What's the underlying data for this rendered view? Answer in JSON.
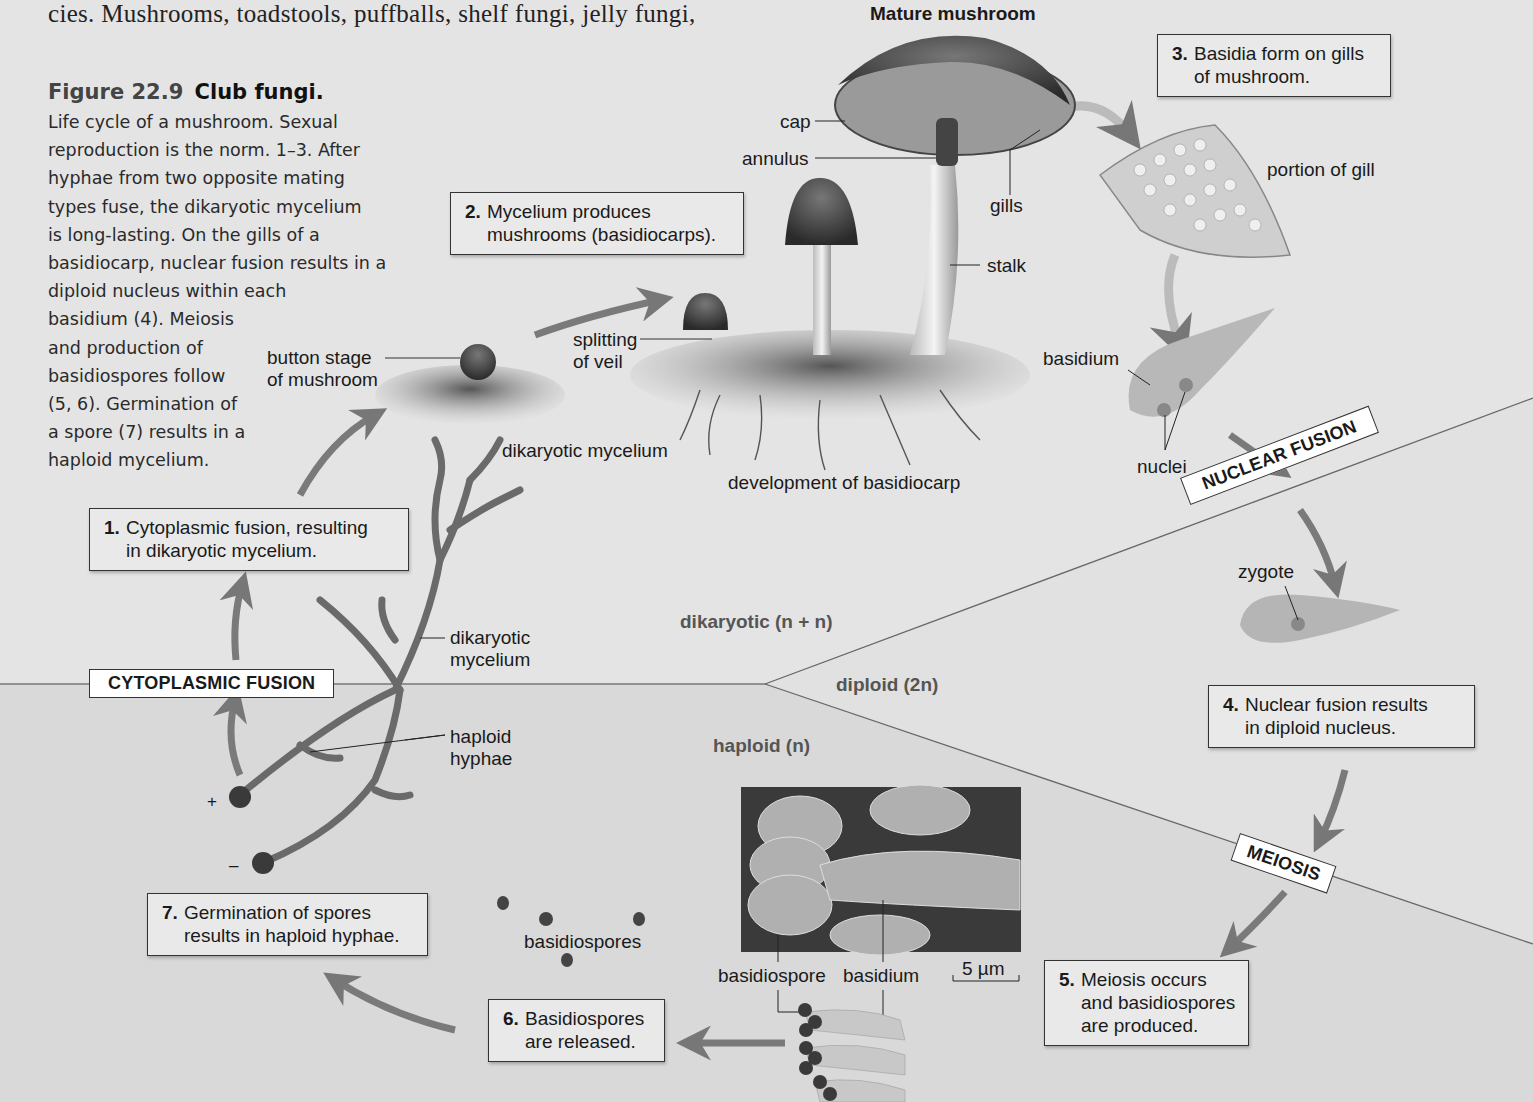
{
  "page": {
    "body_text_fragment": "cies. Mushrooms, toadstools, puffballs, shelf fungi, jelly fungi,"
  },
  "figure": {
    "number": "Figure 22.9",
    "title": "Club fungi.",
    "caption_lines": [
      "Life cycle of a mushroom. Sexual",
      "reproduction is the norm. 1–3. After",
      "hyphae from two opposite mating",
      "types fuse, the dikaryotic mycelium",
      "is long-lasting. On the gills of a",
      "basidiocarp, nuclear fusion results in a",
      "diploid nucleus within each",
      "basidium (4). Meiosis",
      "and production of",
      "basidiospores follow",
      "(5, 6). Germination of",
      "a spore (7) results in a",
      "haploid mycelium."
    ],
    "caption_text": "Life cycle of a mushroom. Sexual reproduction is the norm. 1–3. After hyphae from two opposite mating types fuse, the dikaryotic mycelium is long-lasting. On the gills of a basidiocarp, nuclear fusion results in a diploid nucleus within each basidium (4). Meiosis and production of basidiospores follow (5, 6). Germination of a spore (7) results in a haploid mycelium."
  },
  "steps": [
    {
      "num": "1.",
      "line1": "Cytoplasmic fusion, resulting",
      "line2": "in dikaryotic mycelium."
    },
    {
      "num": "2.",
      "line1": "Mycelium produces",
      "line2": "mushrooms (basidiocarps)."
    },
    {
      "num": "3.",
      "line1": "Basidia form on gills",
      "line2": "of mushroom."
    },
    {
      "num": "4.",
      "line1": "Nuclear fusion results",
      "line2": "in diploid nucleus."
    },
    {
      "num": "5.",
      "line1": "Meiosis occurs",
      "line2": "and basidiospores",
      "line3": "are produced."
    },
    {
      "num": "6.",
      "line1": "Basidiospores",
      "line2": "are released."
    },
    {
      "num": "7.",
      "line1": "Germination of spores",
      "line2": "results in haploid hyphae."
    }
  ],
  "phases": {
    "cytoplasmic_fusion": "CYTOPLASMIC FUSION",
    "nuclear_fusion": "NUCLEAR FUSION",
    "meiosis": "MEIOSIS"
  },
  "regions": {
    "dikaryotic": "dikaryotic (n + n)",
    "diploid": "diploid (2n)",
    "haploid": "haploid (n)"
  },
  "labels": {
    "mature_mushroom": "Mature mushroom",
    "cap": "cap",
    "annulus": "annulus",
    "gills": "gills",
    "stalk": "stalk",
    "portion_of_gill": "portion of gill",
    "basidium_top": "basidium",
    "nuclei": "nuclei",
    "zygote": "zygote",
    "button_stage_1": "button stage",
    "button_stage_2": "of mushroom",
    "splitting_1": "splitting",
    "splitting_2": "of veil",
    "dikaryotic_mycelium_ground": "dikaryotic mycelium",
    "development": "development of basidiocarp",
    "dikaryotic_mycelium_1": "dikaryotic",
    "dikaryotic_mycelium_2": "mycelium",
    "haploid_hyphae_1": "haploid",
    "haploid_hyphae_2": "hyphae",
    "plus": "+",
    "minus": "–",
    "basidiospores": "basidiospores",
    "sem_basidiospore": "basidiospore",
    "sem_basidium": "basidium",
    "scale_bar": "5 µm"
  },
  "colors": {
    "background_upper": "#e4e4e4",
    "background_lower": "#d9d9d9",
    "box_fill": "#e9e9e9",
    "phase_fill": "#ffffff",
    "arrow": "#7a7a7a",
    "text": "#1a1a1a"
  }
}
